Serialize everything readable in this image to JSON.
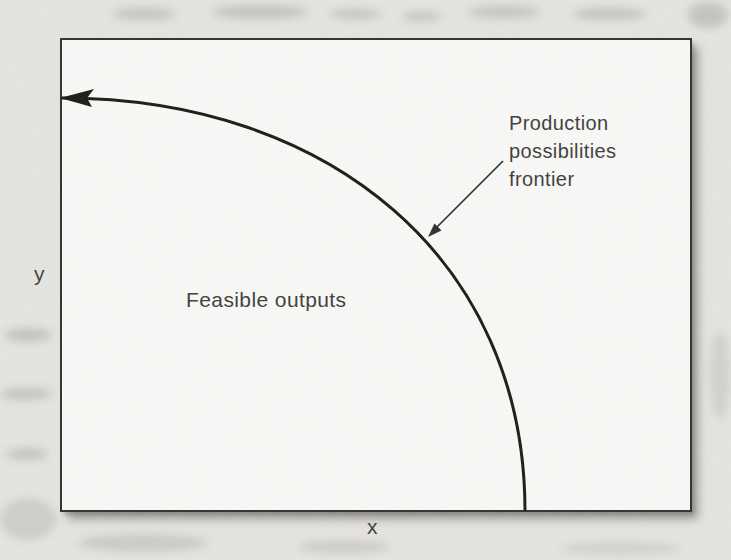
{
  "figure": {
    "axis": {
      "x_label": "x",
      "y_label": "y"
    },
    "region_label": "Feasible outputs",
    "curve_label_lines": [
      "Production",
      "possibilities",
      "frontier"
    ],
    "arrows": {
      "curve_end": "left-pointing arrowhead at top of frontier curve",
      "annotation": "thin arrow from label pointing down-left to the curve"
    },
    "colors": {
      "page_background": "#e8e7e4",
      "panel_background": "#fcfcfa",
      "panel_border": "#2e2d2b",
      "curve_ink": "#161613",
      "text_ink": "#3b3a38",
      "shadow": "#8a8884"
    }
  }
}
